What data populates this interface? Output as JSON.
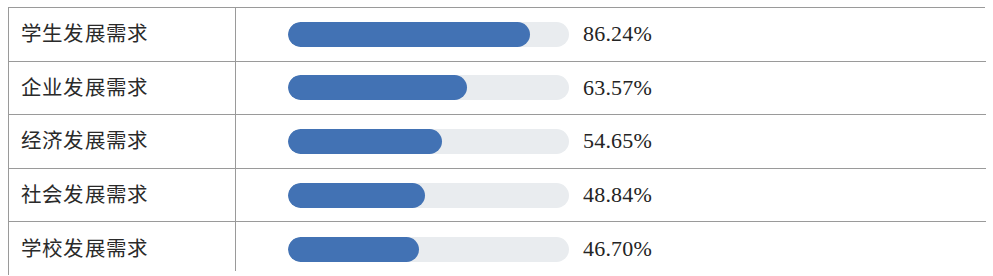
{
  "table": {
    "accent_color": "#4272b4",
    "track_color": "#e9ecef",
    "border_color": "#9a9a9a",
    "text_color": "#242424",
    "rows": [
      {
        "label": "学生发展需求",
        "percent_label": "86.24%",
        "value": 86.24
      },
      {
        "label": "企业发展需求",
        "percent_label": "63.57%",
        "value": 63.57
      },
      {
        "label": "经济发展需求",
        "percent_label": "54.65%",
        "value": 54.65
      },
      {
        "label": "社会发展需求",
        "percent_label": "48.84%",
        "value": 48.84
      },
      {
        "label": "学校发展需求",
        "percent_label": "46.70%",
        "value": 46.7
      }
    ]
  },
  "chart_data": {
    "type": "bar",
    "title": "",
    "xlabel": "",
    "ylabel": "",
    "orientation": "horizontal",
    "grid": false,
    "legend": null,
    "xlim": [
      0,
      100
    ],
    "unit": "%",
    "categories": [
      "学生发展需求",
      "企业发展需求",
      "经济发展需求",
      "社会发展需求",
      "学校发展需求"
    ],
    "values": [
      86.24,
      63.57,
      54.65,
      48.84,
      46.7
    ],
    "data_labels": [
      "86.24%",
      "63.57%",
      "54.65%",
      "48.84%",
      "46.70%"
    ]
  }
}
